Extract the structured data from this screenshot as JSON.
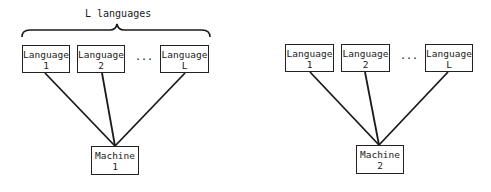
{
  "diagram": {
    "left": {
      "group_label": "L languages",
      "languages": [
        {
          "line1": "Language",
          "line2": "1"
        },
        {
          "line1": "Language",
          "line2": "2"
        },
        {
          "line1": "Language",
          "line2": "L"
        }
      ],
      "ellipsis": "...",
      "machine": {
        "line1": "Machine",
        "line2": "1"
      }
    },
    "right": {
      "languages": [
        {
          "line1": "Language",
          "line2": "1"
        },
        {
          "line1": "Language",
          "line2": "2"
        },
        {
          "line1": "Language",
          "line2": "L"
        }
      ],
      "ellipsis": "...",
      "machine": {
        "line1": "Machine",
        "line2": "2"
      }
    },
    "colors": {
      "stroke": "#1a1a1a",
      "background": "#ffffff"
    }
  }
}
